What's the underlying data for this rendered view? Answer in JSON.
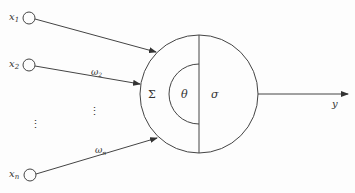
{
  "diagram": {
    "type": "artificial-neuron-model",
    "inputs": [
      {
        "label": "x",
        "sub": "1"
      },
      {
        "label": "x",
        "sub": "2"
      },
      {
        "label": "x",
        "sub": "n"
      }
    ],
    "weights": [
      {
        "label": "ω",
        "sub": "2"
      },
      {
        "label": "ω",
        "sub": "n"
      }
    ],
    "ellipsis": "⋮",
    "neuron": {
      "sum_symbol": "Σ",
      "threshold_symbol": "θ",
      "activation_symbol": "σ"
    },
    "output": {
      "label": "y"
    },
    "colors": {
      "line": "#444444",
      "text": "#333333",
      "background": "#fdfdfd"
    }
  }
}
